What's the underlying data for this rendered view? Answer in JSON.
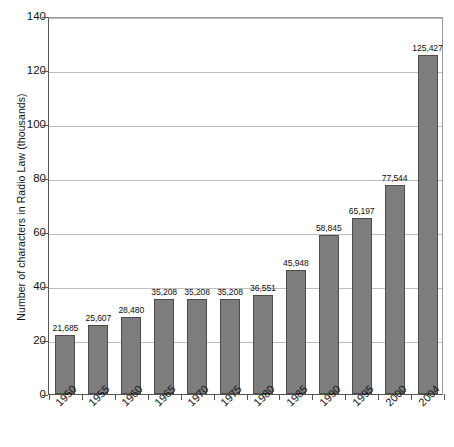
{
  "chart_data": {
    "type": "bar",
    "title": "",
    "xlabel": "",
    "ylabel": "Number of characters in Radio Law (thousands)",
    "categories": [
      "1950",
      "1955",
      "1960",
      "1965",
      "1970",
      "1975",
      "1980",
      "1985",
      "1990",
      "1995",
      "2000",
      "2004"
    ],
    "values": [
      21685,
      25607,
      28480,
      35208,
      35208,
      35208,
      36551,
      45948,
      58845,
      65197,
      77544,
      125427
    ],
    "value_labels": [
      "21,685",
      "25,607",
      "28,480",
      "35,208",
      "35,208",
      "35,208",
      "36,551",
      "45,948",
      "58,845",
      "65,197",
      "77,544",
      "125,427"
    ],
    "yticks": [
      0,
      20,
      40,
      60,
      80,
      100,
      120,
      140
    ],
    "ytick_labels": [
      "0",
      "20",
      "40",
      "60",
      "80",
      "100",
      "120",
      "140"
    ],
    "ylim": [
      0,
      140
    ],
    "unit_scale": 1000,
    "grid": true,
    "legend": false,
    "series_name": "Number of characters in Radio Law",
    "colors": {
      "bar_fill": "#7d7d7d",
      "bar_edge": "#4d4d4d",
      "gridline": "#bdbdbd",
      "axis": "#555555",
      "text": "#141414",
      "background": "#ffffff"
    }
  }
}
